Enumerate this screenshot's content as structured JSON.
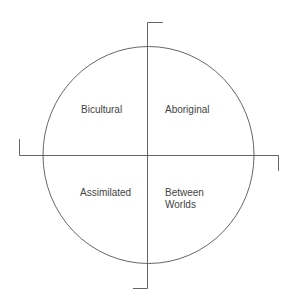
{
  "diagram": {
    "type": "quadrant-circle",
    "quadrants": {
      "top_left": "Bicultural",
      "top_right": "Aboriginal",
      "bottom_left": "Assimilated",
      "bottom_right_line1": "Between",
      "bottom_right_line2": "Worlds"
    },
    "colors": {
      "line": "#444444",
      "text": "#444444",
      "background": "#ffffff"
    }
  }
}
